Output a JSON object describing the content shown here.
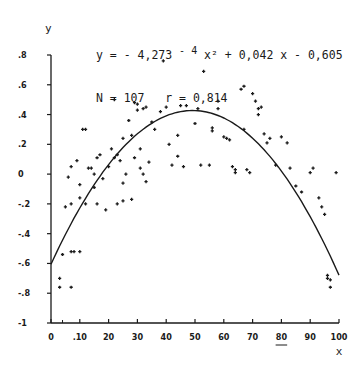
{
  "chart_data": {
    "type": "scatter",
    "title_line1_pre": "y = - 4,273 ",
    "title_line1_exp": "- 4",
    "title_line1_post": " x² + 0,042 x - 0,605",
    "title_line2": "N = 107   r = 0,814",
    "xlabel": "x",
    "ylabel": "y",
    "xlim": [
      0,
      100
    ],
    "ylim": [
      -1,
      0.8
    ],
    "x_ticks": [
      0,
      10,
      20,
      30,
      40,
      50,
      60,
      70,
      80,
      90,
      100
    ],
    "x_tick_labels": [
      "0",
      ".10",
      "20",
      "30",
      "40",
      "50",
      "60",
      "70",
      "80",
      "90",
      "100"
    ],
    "y_ticks": [
      0.8,
      0.6,
      0.4,
      0.2,
      0,
      -0.2,
      -0.4,
      -0.6,
      -0.8,
      -1
    ],
    "y_tick_labels": [
      ".8",
      ".6",
      ".4",
      ".2",
      "0",
      "-.2",
      "-.4",
      "-.6",
      "-.8",
      "-1"
    ],
    "grid": false,
    "fit": {
      "type": "quadratic",
      "a": -0.0004273,
      "b": 0.042,
      "c": -0.605,
      "N": 107,
      "r": 0.814
    },
    "points": [
      [
        3,
        -0.7
      ],
      [
        3,
        -0.76
      ],
      [
        4,
        -0.54
      ],
      [
        5,
        -0.22
      ],
      [
        7,
        -0.76
      ],
      [
        7,
        -0.52
      ],
      [
        8,
        -0.52
      ],
      [
        10,
        -0.52
      ],
      [
        6,
        -0.02
      ],
      [
        7,
        0.05
      ],
      [
        9,
        0.09
      ],
      [
        10,
        -0.16
      ],
      [
        11,
        0.3
      ],
      [
        12,
        0.3
      ],
      [
        13,
        0.04
      ],
      [
        14,
        0.04
      ],
      [
        7,
        -0.2
      ],
      [
        10,
        -0.07
      ],
      [
        15,
        0.0
      ],
      [
        16,
        0.11
      ],
      [
        16,
        -0.2
      ],
      [
        12,
        -0.2
      ],
      [
        20,
        0.05
      ],
      [
        15,
        -0.09
      ],
      [
        21,
        0.17
      ],
      [
        22,
        0.11
      ],
      [
        22,
        0.5
      ],
      [
        23,
        0.13
      ],
      [
        24,
        0.09
      ],
      [
        25,
        -0.06
      ],
      [
        25,
        0.24
      ],
      [
        26,
        0.0
      ],
      [
        17,
        0.13
      ],
      [
        18,
        -0.03
      ],
      [
        19,
        -0.24
      ],
      [
        23,
        -0.2
      ],
      [
        25,
        -0.18
      ],
      [
        27,
        0.36
      ],
      [
        28,
        0.26
      ],
      [
        29,
        0.48
      ],
      [
        30,
        0.47
      ],
      [
        30,
        0.43
      ],
      [
        32,
        0.44
      ],
      [
        33,
        0.45
      ],
      [
        34,
        0.08
      ],
      [
        35,
        0.35
      ],
      [
        36,
        0.3
      ],
      [
        31,
        0.17
      ],
      [
        29,
        0.11
      ],
      [
        31,
        0.04
      ],
      [
        32,
        0.0
      ],
      [
        33,
        -0.05
      ],
      [
        28,
        -0.17
      ],
      [
        39,
        0.76
      ],
      [
        40,
        0.45
      ],
      [
        41,
        0.2
      ],
      [
        42,
        0.06
      ],
      [
        44,
        0.12
      ],
      [
        44,
        0.26
      ],
      [
        45,
        0.46
      ],
      [
        46,
        0.05
      ],
      [
        47,
        0.46
      ],
      [
        50,
        0.34
      ],
      [
        51,
        0.44
      ],
      [
        52,
        0.06
      ],
      [
        53,
        0.69
      ],
      [
        55,
        0.06
      ],
      [
        56,
        0.31
      ],
      [
        56,
        0.29
      ],
      [
        58,
        0.44
      ],
      [
        60,
        0.25
      ],
      [
        61,
        0.24
      ],
      [
        62,
        0.23
      ],
      [
        63,
        0.05
      ],
      [
        64,
        0.03
      ],
      [
        64,
        0.01
      ],
      [
        66,
        0.57
      ],
      [
        67,
        0.59
      ],
      [
        67,
        0.3
      ],
      [
        68,
        0.03
      ],
      [
        69,
        0.01
      ],
      [
        70,
        0.54
      ],
      [
        71,
        0.49
      ],
      [
        72,
        0.44
      ],
      [
        72,
        0.4
      ],
      [
        73,
        0.45
      ],
      [
        74,
        0.27
      ],
      [
        75,
        0.21
      ],
      [
        76,
        0.24
      ],
      [
        78,
        0.06
      ],
      [
        80,
        0.25
      ],
      [
        82,
        0.21
      ],
      [
        83,
        0.04
      ],
      [
        85,
        -0.08
      ],
      [
        87,
        -0.12
      ],
      [
        90,
        0.01
      ],
      [
        91,
        0.04
      ],
      [
        93,
        -0.16
      ],
      [
        94,
        -0.22
      ],
      [
        95,
        -0.27
      ],
      [
        96,
        -0.68
      ],
      [
        96,
        -0.7
      ],
      [
        97,
        -0.71
      ],
      [
        97,
        -0.76
      ],
      [
        99,
        0.01
      ],
      [
        58,
        0.49
      ],
      [
        38,
        0.42
      ]
    ]
  },
  "annotations": {
    "underline_near_80": true
  }
}
